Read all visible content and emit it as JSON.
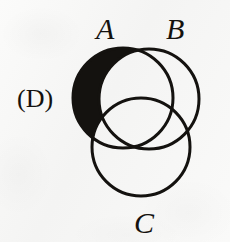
{
  "figure": {
    "kind": "venn-diagram",
    "choice_label": "(D)",
    "background_color": "#f7f7f6",
    "stroke_color": "#14120f",
    "shade_color": "#14120f",
    "stroke_width": 3,
    "canvas": {
      "width": 230,
      "height": 242
    },
    "set_labels": {
      "a": "A",
      "b": "B",
      "c": "C"
    },
    "circles": [
      {
        "id": "A",
        "label": "A",
        "cx": 123,
        "cy": 98,
        "r": 50,
        "filled": false
      },
      {
        "id": "B",
        "label": "B",
        "cx": 149,
        "cy": 99,
        "r": 50,
        "filled": false
      },
      {
        "id": "C",
        "label": "C",
        "cx": 141,
        "cy": 147,
        "r": 49,
        "filled": false
      }
    ],
    "shaded_region": {
      "description": "A only",
      "expression": "A \\ (B ∪ C)",
      "color": "#14120f"
    },
    "label_positions": {
      "a": {
        "x": 108,
        "y": 30
      },
      "b": {
        "x": 178,
        "y": 30
      },
      "c": {
        "x": 147,
        "y": 224
      },
      "choice": {
        "x": 37,
        "y": 102
      }
    }
  }
}
